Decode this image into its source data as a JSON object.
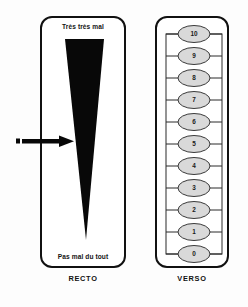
{
  "figure": {
    "background_color": "#fdfdfd",
    "ink_color": "#111111",
    "ellipse_fill": "#d9d9d9"
  },
  "recto": {
    "caption": "RECTO",
    "top_label": "Très très mal",
    "bottom_label": "Pas mal du tout",
    "wedge": {
      "name": "visual-analogue-wedge",
      "fill": "#080808",
      "orientation": "wide-top-narrow-bottom"
    },
    "marker": {
      "name": "patient-mark-arrow",
      "direction": "right",
      "color": "#080808"
    }
  },
  "verso": {
    "caption": "VERSO",
    "scale_values": [
      "10",
      "9",
      "8",
      "7",
      "6",
      "5",
      "4",
      "3",
      "2",
      "1",
      "0"
    ],
    "ellipse_fill": "#d9d9d9",
    "ellipse_stroke": "#3a3a3a"
  }
}
